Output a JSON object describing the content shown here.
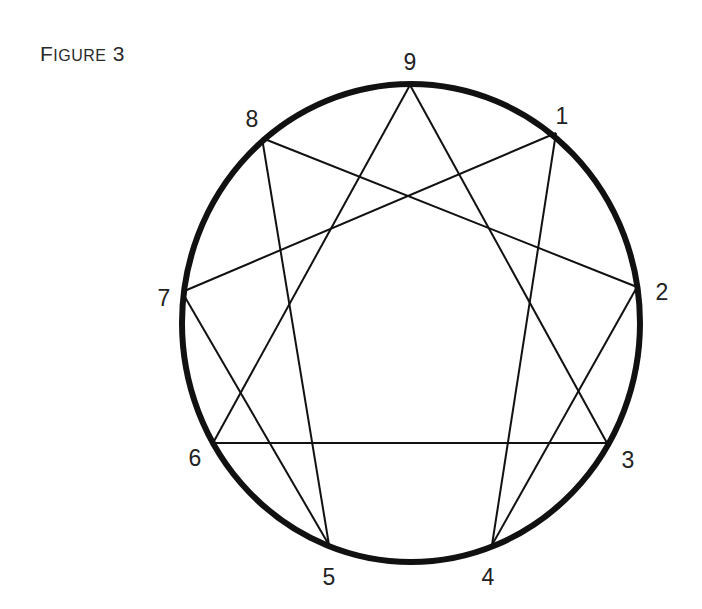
{
  "figure": {
    "title_first": "F",
    "title_rest": "IGURE",
    "title_number": "3"
  },
  "diagram": {
    "type": "enneagram",
    "circle": {
      "cx": 411,
      "cy": 323,
      "rx": 229,
      "ry": 239,
      "stroke": "#111111",
      "stroke_width": 6
    },
    "points": [
      {
        "id": "1",
        "label": "1",
        "x": 556,
        "y": 133,
        "lx": 562,
        "ly": 124
      },
      {
        "id": "2",
        "label": "2",
        "x": 637,
        "y": 287,
        "lx": 662,
        "ly": 300
      },
      {
        "id": "3",
        "label": "3",
        "x": 607,
        "y": 443,
        "lx": 628,
        "ly": 468
      },
      {
        "id": "4",
        "label": "4",
        "x": 492,
        "y": 545,
        "lx": 488,
        "ly": 585
      },
      {
        "id": "5",
        "label": "5",
        "x": 329,
        "y": 545,
        "lx": 329,
        "ly": 585
      },
      {
        "id": "6",
        "label": "6",
        "x": 213,
        "y": 443,
        "lx": 195,
        "ly": 466
      },
      {
        "id": "7",
        "label": "7",
        "x": 182,
        "y": 292,
        "lx": 164,
        "ly": 306
      },
      {
        "id": "8",
        "label": "8",
        "x": 262,
        "y": 138,
        "lx": 252,
        "ly": 127
      },
      {
        "id": "9",
        "label": "9",
        "x": 410,
        "y": 85,
        "lx": 410,
        "ly": 70
      }
    ],
    "lines": [
      [
        "1",
        "4"
      ],
      [
        "4",
        "2"
      ],
      [
        "2",
        "8"
      ],
      [
        "8",
        "5"
      ],
      [
        "5",
        "7"
      ],
      [
        "7",
        "1"
      ],
      [
        "9",
        "3"
      ],
      [
        "3",
        "6"
      ],
      [
        "6",
        "9"
      ]
    ],
    "line_color": "#111111",
    "line_width": 2
  }
}
